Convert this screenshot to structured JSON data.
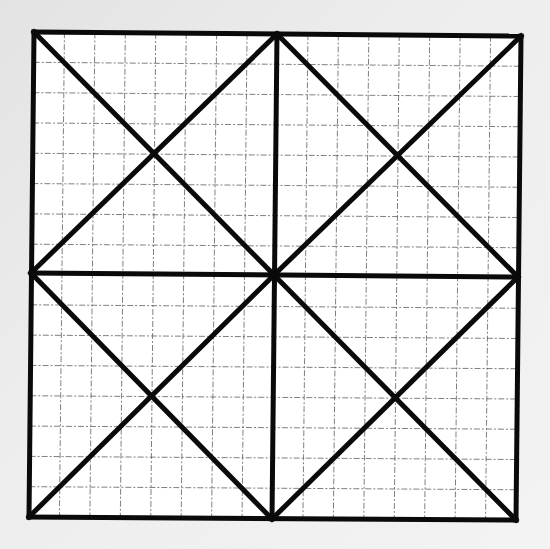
{
  "diagram": {
    "type": "geometric-figure-on-graph-paper",
    "colors": {
      "background": "#e8e8e8",
      "paper": "#ffffff",
      "grid": "#555555",
      "lines": "#0a0a0a"
    },
    "square": {
      "top_left": [
        34,
        32
      ],
      "top_right": [
        521,
        36
      ],
      "bottom_right": [
        516,
        520
      ],
      "bottom_left": [
        29,
        517
      ]
    },
    "midpoints": {
      "top": [
        277,
        34
      ],
      "right": [
        518,
        277
      ],
      "bottom": [
        272,
        519
      ],
      "left": [
        31,
        273
      ],
      "center": [
        274,
        275
      ]
    },
    "grid": {
      "cells_per_side": 16,
      "style": "dashed"
    },
    "line_width": 5
  }
}
